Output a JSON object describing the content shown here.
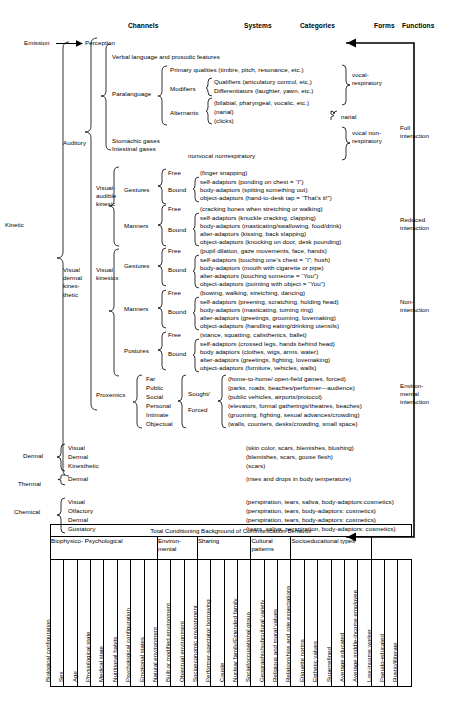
{
  "diagram": {
    "column_headers": [
      {
        "label": "Channels",
        "x": 128,
        "y": 24
      },
      {
        "label": "Systems",
        "x": 244,
        "y": 24
      },
      {
        "label": "Categories",
        "x": 300,
        "y": 24
      },
      {
        "label": "Forms",
        "x": 374,
        "y": 24
      },
      {
        "label": "Functions",
        "x": 600,
        "y": 24
      }
    ],
    "emission_perception": {
      "emission": "Emission",
      "perception": "Perception"
    },
    "channels": [
      {
        "label": "Auditory",
        "x": 63,
        "y": 142
      },
      {
        "label": "Kinetic",
        "x": 6,
        "y": 220
      },
      {
        "label": "Visual\ndermal\nkines-\nthetic",
        "x": 63,
        "y": 273
      },
      {
        "label": "Dermal",
        "x": 10,
        "y": 451
      },
      {
        "label": "Thermal",
        "x": 10,
        "y": 479
      },
      {
        "label": "Chemical",
        "x": 10,
        "y": 505
      }
    ],
    "systems": [
      {
        "label": "Visual-\naudible\nkinesic",
        "x": 96,
        "y": 186
      },
      {
        "label": "Visual\nkinesics",
        "x": 96,
        "y": 272
      },
      {
        "label": "Proxemics",
        "x": 96,
        "y": 390
      }
    ],
    "forms_top": {
      "verbal": "Verbal language and prosodic features",
      "stomachic": "Stomachic gases",
      "intestinal": "Intestinal gases"
    },
    "paralanguage": {
      "label": "Paralanguage",
      "primary": "Primary qualities (timbre, pitch, resonance, etc.)",
      "modifiers_label": "Modifiers",
      "modifiers": [
        "Qualifiers (articulatory control, etc.)",
        "Differentiators (laughter, yawn, etc.)"
      ],
      "alternants_label": "Alternants",
      "alternants": [
        "(bilabial, pharyngeal, vocalic, etc.)",
        "(narial)",
        "(clicks)"
      ],
      "nonvocal": "nonvocal nonrespiratory"
    },
    "function_labels": [
      {
        "label": "vocal-\nrespiratory",
        "x": 366,
        "y": 73
      },
      {
        "label": "narial",
        "x": 370,
        "y": 113
      },
      {
        "label": "vocal non-\nrespiratory",
        "x": 366,
        "y": 125
      },
      {
        "label": "Full\ninteraction",
        "x": 417,
        "y": 124
      },
      {
        "label": "Reduced\ninteraction",
        "x": 417,
        "y": 216
      },
      {
        "label": "Non-\ninteraction",
        "x": 417,
        "y": 298
      },
      {
        "label": "Environ-\nmental\ninteraction",
        "x": 417,
        "y": 382
      }
    ],
    "visual_audible_kinesic": {
      "gestures": {
        "label": "Gestures",
        "free_label": "Free",
        "free": "(finger snapping)",
        "bound_label": "Bound",
        "bound": [
          "self-adaptors (ponding on chest = “I”)",
          "body-adaptors (spitting something out)",
          "object-adaptors (hand-to-desk tap = “That’s it!”)"
        ]
      },
      "manners": {
        "label": "Manners",
        "free_label": "Free",
        "free": "(cracking bones when stretching or walking)",
        "bound_label": "Bound",
        "bound": [
          "self-adaptors (knuckle cracking, clapping)",
          "body-adaptors (masticating/swallowing, food/drink)",
          "alter-adaptors (kissing, back slapping)",
          "object-adaptors (knocking on door, desk pounding)"
        ]
      }
    },
    "visual_kinesics": {
      "gestures": {
        "label": "Gestures",
        "free_label": "Free",
        "free": "(pupil dilation, gaze movements, face, hands)",
        "bound_label": "Bound",
        "bound": [
          "self-adaptors (touching one’s chest = “I”; hush)",
          "body-adaptors (mouth with cigarette or pipe)",
          "alter-adaptors (touching someone = “You”)",
          "object-adaptors (pointing with object = “You”)"
        ]
      },
      "manners": {
        "label": "Manners",
        "free_label": "Free",
        "free": "(bowing, walking, stretching, dancing)",
        "bound_label": "Bound",
        "bound": [
          "self-adaptors (preening, scratching, holding head)",
          "body-adaptors (masticating, turning ring)",
          "alter-adaptors (greetings, grooming, lovemaking)",
          "object-adaptors (handling eating/drinking utensils)"
        ]
      },
      "postures": {
        "label": "Postures",
        "free_label": "Free",
        "free": "(stance, squatting, calisthenics, ballet)",
        "bound_label": "Bound",
        "bound": [
          "self-adaptors (crossed legs, hands behind head)",
          "body adaptors (clothes, wigs, arms, water)",
          "alter-adaptors (greetings, fighting, lovemaking)",
          "object-adaptors (furniture, vehicles, walls)"
        ]
      }
    },
    "proxemics": {
      "distances": [
        "Far",
        "Public",
        "Social",
        "Personal",
        "Intimate",
        "Objectual"
      ],
      "sought_label": "Sought/",
      "forced_label": "Forced",
      "forms": [
        "(home-to-home/ open-field games, forced)",
        "(parks, roads, beaches/performer—audience)",
        "(public vehicles, airports/protocol)",
        "(elevators, formal gatherings/theatres, beaches)",
        "(grooming, fighting, sexual advances/crowding)",
        "(walls, counters, desks/crowding, small space)"
      ]
    },
    "dermal": {
      "label": "Dermal",
      "systems": [
        "Visual",
        "Dermal",
        "Kinesthetic"
      ],
      "forms": [
        "(skin color, scars, blemishes, blushing)",
        "(blemishes, scars, goose flesh)",
        "(scars)"
      ]
    },
    "thermal": {
      "label": "Thermal",
      "systems": [
        "Dermal"
      ],
      "forms": [
        "(rises and drops in body temperature)"
      ]
    },
    "chemical": {
      "label": "Chemical",
      "systems": [
        "Visual",
        "Olfactory",
        "Dermal",
        "Gustatory"
      ],
      "forms": [
        "(perspiration, tears, saliva, body-adaptors:cosmetics)",
        "(perspiration, tears, body-adaptors: cosmetics)",
        "(perspiration, tears, body-adaptors: cosmetics)",
        "(tears, saliva, perspiration, body-adaptors: cosmetics)"
      ]
    }
  },
  "conditioning_table": {
    "title": "Total Conditioning Background of Communication Behavior",
    "groups": [
      {
        "label": "Biophysico-\nPsychological",
        "span": 8
      },
      {
        "label": "Environ-\nmental",
        "span": 3
      },
      {
        "label": "Sharing",
        "span": 4
      },
      {
        "label": "Cultural\npatterns",
        "span": 3
      },
      {
        "label": "Socioeducational\ntypes",
        "span": 6
      }
    ],
    "columns": [
      "Biological configuration",
      "Sex",
      "Age",
      "Physiological state",
      "Medical state",
      "Nutritional habits",
      "Psychological configuration",
      "Emotional states",
      "Natural environment",
      "Built or modified environment",
      "Objectual environment",
      "Socioeconomic environment",
      "Performer-spectator borrowing",
      "Couple",
      "Nuclear family/Extended family",
      "Social/occupational group",
      "Geographic/subcultural variety",
      "Religious and moral values",
      "Relationships and role expectations",
      "Etiquette norms",
      "Esthetic values",
      "Superrefined",
      "Average educated",
      "Average middle-income employee",
      "Low-income worker",
      "Pseudo-educated",
      "Rustic/illiterate"
    ]
  }
}
